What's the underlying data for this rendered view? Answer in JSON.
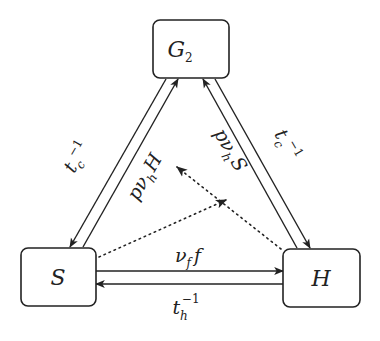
{
  "diagram": {
    "type": "state-transition",
    "nodes": {
      "g2": {
        "label": "G",
        "sub": "2"
      },
      "s": {
        "label": "S"
      },
      "h": {
        "label": "H"
      }
    },
    "edges": {
      "g2_to_s": {
        "base": "t",
        "sub": "c",
        "sup": "−1"
      },
      "s_to_g2": {
        "base": "pν",
        "sub": "h",
        "tail": "H"
      },
      "h_to_g2": {
        "base": "pν",
        "sub": "h",
        "tail": "S"
      },
      "g2_to_h": {
        "base": "t",
        "sub": "c",
        "sup": "−1"
      },
      "s_to_h": {
        "base": "ν",
        "sub": "f",
        "tail": "f"
      },
      "h_to_s": {
        "base": "t",
        "sub": "h",
        "sup": "−1"
      }
    },
    "colors": {
      "stroke": "#222222",
      "background": "#ffffff"
    }
  }
}
